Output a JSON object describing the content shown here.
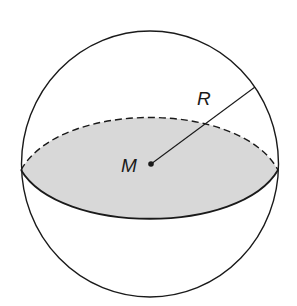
{
  "diagram": {
    "type": "sphere-cross-section",
    "labels": {
      "center": "M",
      "radius": "R"
    },
    "colors": {
      "stroke": "#1a1a1a",
      "section_fill": "#d8d8d8",
      "background": "#ffffff"
    },
    "elements": [
      {
        "name": "sphere-outline",
        "shape": "circle"
      },
      {
        "name": "great-circle-section",
        "shape": "ellipse",
        "front": "solid",
        "back": "dashed",
        "fill": "shaded"
      },
      {
        "name": "center-point",
        "label": "M"
      },
      {
        "name": "radius-line",
        "label": "R"
      }
    ]
  }
}
